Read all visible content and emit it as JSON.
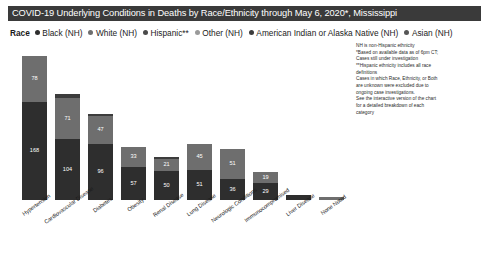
{
  "title": "COVID-19 Underlying Conditions in Deaths by Race/Ethnicity through May 6, 2020*, Mississippi",
  "legend": {
    "title": "Race",
    "items": [
      {
        "label": "Black (NH)",
        "color": "#2e2e2e"
      },
      {
        "label": "White (NH)",
        "color": "#6e6e6e"
      },
      {
        "label": "Hispanic**",
        "color": "#4a4a4a"
      },
      {
        "label": "Other (NH)",
        "color": "#9a9a9a"
      },
      {
        "label": "American Indian or Alaska Native (NH)",
        "color": "#3c3c3c"
      },
      {
        "label": "Asian (NH)",
        "color": "#565656"
      }
    ]
  },
  "notes": [
    "NH is non-Hispanic ethnicity",
    "*Based on available data as of 6pm CT;",
    "Cases still under investigation",
    "**Hispanic ethnicity includes all race",
    "definitions",
    "Cases in which Race, Ethnicity, or Both",
    "are unknown were excluded due to",
    "ongoing case investigations.",
    "See the interactive version of the chart",
    "for a detailed breakdown of each",
    "category"
  ],
  "chart_data": {
    "type": "bar",
    "subtype": "stacked-bar",
    "title": "COVID-19 Underlying Conditions in Deaths by Race/Ethnicity through May 6, 2020*, Mississippi",
    "xlabel": "",
    "ylabel": "",
    "grid": false,
    "legend_position": "top",
    "ylim": [
      0,
      260
    ],
    "categories": [
      "Hypertension",
      "Cardiovascular Disease",
      "Diabetes",
      "Obesity",
      "Renal Disease",
      "Lung Disease",
      "Neurologic Conditions",
      "Immunocompromised",
      "Liver Disease",
      "None Noted"
    ],
    "series": [
      {
        "name": "Black (NH)",
        "color": "#2e2e2e",
        "values": [
          168,
          104,
          96,
          57,
          50,
          51,
          36,
          29,
          9,
          0
        ]
      },
      {
        "name": "White (NH)",
        "color": "#6e6e6e",
        "values": [
          78,
          71,
          47,
          33,
          21,
          45,
          51,
          19,
          0,
          5
        ]
      },
      {
        "name": "Other (NH)",
        "color": "#3c3c3c",
        "values": [
          0,
          6,
          4,
          0,
          2,
          0,
          0,
          0,
          0,
          0
        ]
      }
    ],
    "bar_labels": {
      "Hypertension": {
        "black": "168",
        "white": "78"
      },
      "Cardiovascular Disease": {
        "black": "104",
        "white": "71"
      },
      "Diabetes": {
        "black": "96",
        "white": "47"
      },
      "Obesity": {
        "black": "57",
        "white": "33"
      },
      "Renal Disease": {
        "black": "50",
        "white": "21"
      },
      "Lung Disease": {
        "black": "51",
        "white": "45"
      },
      "Neurologic Conditions": {
        "black": "36",
        "white": "51"
      },
      "Immunocompromised": {
        "black": "29",
        "white": "19"
      },
      "Liver Disease": {
        "black": "9",
        "white": ""
      },
      "None Noted": {
        "black": "",
        "white": ""
      }
    }
  },
  "colors": {
    "title_bar_bg": "#3a3a3a",
    "title_bar_text": "#ffffff",
    "page_bg": "#ffffff"
  }
}
